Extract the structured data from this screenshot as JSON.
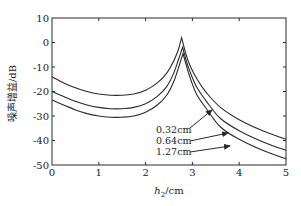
{
  "chart_data": {
    "type": "line",
    "title": "",
    "xlabel_italic": "h",
    "xlabel_sub": "2",
    "xlabel_unit": "/cm",
    "xlabel": "h2/cm",
    "ylabel": "噪声增益/dB",
    "xlim": [
      0,
      5
    ],
    "ylim": [
      -50,
      10
    ],
    "xticks": [
      0,
      1,
      2,
      3,
      4,
      5
    ],
    "yticks": [
      10,
      0,
      -10,
      -20,
      -30,
      -40,
      -50
    ],
    "grid": false,
    "legend": "annotations with arrows",
    "series": [
      {
        "name": "0.32cm",
        "x": [
          0,
          0.25,
          0.5,
          0.75,
          1.0,
          1.25,
          1.5,
          1.75,
          2.0,
          2.25,
          2.45,
          2.6,
          2.7,
          2.77,
          2.85,
          2.95,
          3.1,
          3.3,
          3.6,
          4.0,
          4.5,
          5.0
        ],
        "y": [
          -14,
          -16.5,
          -18.5,
          -20,
          -21,
          -21.5,
          -21.5,
          -21,
          -19.5,
          -16.5,
          -12.5,
          -7.5,
          -3,
          2,
          -4,
          -9.5,
          -15,
          -20.5,
          -26.5,
          -31.5,
          -36,
          -39.5
        ]
      },
      {
        "name": "0.64cm",
        "x": [
          0,
          0.25,
          0.5,
          0.75,
          1.0,
          1.25,
          1.5,
          1.75,
          2.0,
          2.25,
          2.45,
          2.6,
          2.7,
          2.79,
          2.87,
          2.97,
          3.1,
          3.3,
          3.6,
          4.0,
          4.5,
          5.0
        ],
        "y": [
          -20,
          -22,
          -24,
          -25.5,
          -26.5,
          -27,
          -27,
          -26.5,
          -25,
          -22,
          -18,
          -12.5,
          -7,
          -2,
          -7.5,
          -13,
          -18.5,
          -24,
          -31,
          -36,
          -40.5,
          -44
        ]
      },
      {
        "name": "1.27cm",
        "x": [
          0,
          0.25,
          0.5,
          0.75,
          1.0,
          1.25,
          1.5,
          1.75,
          2.0,
          2.25,
          2.45,
          2.6,
          2.7,
          2.8,
          2.88,
          2.98,
          3.1,
          3.3,
          3.6,
          4.0,
          4.5,
          5.0
        ],
        "y": [
          -23.5,
          -25.5,
          -27.5,
          -29,
          -30,
          -30.5,
          -30.5,
          -30,
          -28.5,
          -25.5,
          -21.5,
          -16,
          -10.5,
          -4.5,
          -10,
          -16,
          -21.5,
          -27,
          -34.5,
          -39.5,
          -44,
          -47.5
        ]
      }
    ],
    "annotations": [
      {
        "text": "0.32cm",
        "target_series": "0.32cm"
      },
      {
        "text": "0.64cm",
        "target_series": "0.64cm"
      },
      {
        "text": "1.27cm",
        "target_series": "1.27cm"
      }
    ]
  }
}
